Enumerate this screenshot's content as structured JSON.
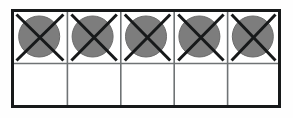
{
  "figure": {
    "background_color": "#fefefe",
    "frame": {
      "x": 1.5,
      "y": 1.5,
      "width": 267,
      "height": 96,
      "stroke_color": "#17191a",
      "stroke_width": 3,
      "fill_color": "#ffffff"
    },
    "grid": {
      "columns": 5,
      "rows": 2,
      "column_width": 53.4,
      "row_heights": [
        53,
        43
      ],
      "divider_color": "#6f7375",
      "divider_width": 1.6,
      "vertical_divider_x": [
        56.4,
        109.8,
        163.2,
        216.6
      ],
      "horizontal_divider_y": [
        54.5
      ]
    },
    "cells": [
      {
        "id": "cell-r1-c1",
        "row": 1,
        "column": 1,
        "marked": true,
        "mark": "circle-with-x"
      },
      {
        "id": "cell-r1-c2",
        "row": 1,
        "column": 2,
        "marked": true,
        "mark": "circle-with-x"
      },
      {
        "id": "cell-r1-c3",
        "row": 1,
        "column": 3,
        "marked": true,
        "mark": "circle-with-x"
      },
      {
        "id": "cell-r1-c4",
        "row": 1,
        "column": 4,
        "marked": true,
        "mark": "circle-with-x"
      },
      {
        "id": "cell-r1-c5",
        "row": 1,
        "column": 5,
        "marked": true,
        "mark": "circle-with-x"
      },
      {
        "id": "cell-r2-c1",
        "row": 2,
        "column": 1,
        "marked": false,
        "mark": "none"
      },
      {
        "id": "cell-r2-c2",
        "row": 2,
        "column": 2,
        "marked": false,
        "mark": "none"
      },
      {
        "id": "cell-r2-c3",
        "row": 2,
        "column": 3,
        "marked": false,
        "mark": "none"
      },
      {
        "id": "cell-r2-c4",
        "row": 2,
        "column": 4,
        "marked": false,
        "mark": "none"
      },
      {
        "id": "cell-r2-c5",
        "row": 2,
        "column": 5,
        "marked": false,
        "mark": "none"
      }
    ],
    "circle": {
      "fill_color": "#7d7d7d",
      "stroke_color": "#6a6a6a",
      "stroke_width": 1,
      "radius": 20.5,
      "center_y": 27.5,
      "center_x": [
        28.2,
        81.6,
        135.0,
        188.4,
        241.8
      ]
    },
    "x_mark": {
      "stroke_color": "#17191a",
      "stroke_width": 3,
      "inset_x": 4,
      "inset_y": 4
    },
    "counts": {
      "total_cells": 10,
      "marked_cells": 5,
      "empty_cells": 5
    }
  }
}
